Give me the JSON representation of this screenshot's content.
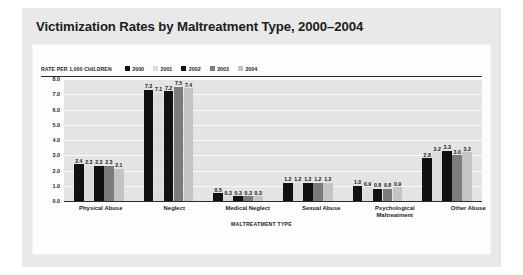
{
  "title": "Victimization Rates by Maltreatment Type, 2000–2004",
  "chart_data": {
    "type": "bar",
    "title": "Victimization Rates by Maltreatment Type, 2000–2004",
    "xlabel": "MALTREATMENT TYPE",
    "ylabel": "RATE PER 1,000 CHILDREN",
    "ylim": [
      0,
      8
    ],
    "yticks": [
      "0.0",
      "1.0",
      "2.0",
      "3.0",
      "4.0",
      "5.0",
      "6.0",
      "7.0",
      "8.0"
    ],
    "grid": true,
    "legend_position": "top",
    "categories": [
      "Physical Abuse",
      "Neglect",
      "Medical Neglect",
      "Sexual Abuse",
      "Psychological Maltreatment",
      "Other Abuse"
    ],
    "series": [
      {
        "name": "2000",
        "color": "#111111",
        "values": [
          2.4,
          7.3,
          0.5,
          1.2,
          1.0,
          2.8
        ]
      },
      {
        "name": "2001",
        "color": "#dcdcdc",
        "values": [
          2.3,
          7.1,
          0.3,
          1.2,
          0.9,
          3.2
        ]
      },
      {
        "name": "2002",
        "color": "#111111",
        "values": [
          2.3,
          7.2,
          0.3,
          1.2,
          0.8,
          3.3
        ]
      },
      {
        "name": "2003",
        "color": "#7b7b7b",
        "values": [
          2.3,
          7.5,
          0.3,
          1.2,
          0.8,
          3.0
        ]
      },
      {
        "name": "2004",
        "color": "#c4c4c4",
        "values": [
          2.1,
          7.4,
          0.3,
          1.2,
          0.9,
          3.2
        ]
      }
    ],
    "value_labels": {
      "Physical Abuse": [
        "2.4",
        "2.3",
        "2.3",
        "2.3",
        "2.1"
      ],
      "Neglect": [
        "7.3",
        "7.1",
        "7.2",
        "7.5",
        "7.4"
      ],
      "Medical Neglect": [
        "0.5",
        "0.3",
        "0.3",
        "0.3",
        "0.3"
      ],
      "Sexual Abuse": [
        "1.2",
        "1.2",
        "1.2",
        "1.2",
        "1.2"
      ],
      "Psychological Maltreatment": [
        "1.0",
        "0.9",
        "0.8",
        "0.8",
        "0.9"
      ],
      "Other Abuse": [
        "2.8",
        "3.2",
        "3.3",
        "3.0",
        "3.2"
      ]
    }
  },
  "colors": {
    "panel": "#e9e9e9",
    "card": "#fdfdfd",
    "plot_background": "#e4e4e4",
    "gridline": "#fafafa",
    "axis": "#2b2b2b",
    "text": "#1d1d1d"
  }
}
